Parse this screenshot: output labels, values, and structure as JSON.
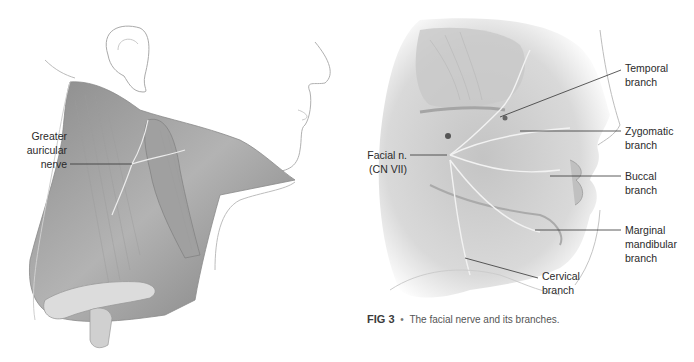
{
  "figure_left": {
    "subject": "neck-lateral-view",
    "labels": {
      "greater_auricular": [
        "Greater",
        "auricular",
        "nerve"
      ]
    }
  },
  "figure_right": {
    "subject": "face-lateral-view-facial-nerve",
    "labels": {
      "temporal": [
        "Temporal",
        "branch"
      ],
      "zygomatic": [
        "Zygomatic",
        "branch"
      ],
      "facial_nerve": [
        "Facial n.",
        "(CN VII)"
      ],
      "buccal": [
        "Buccal",
        "branch"
      ],
      "marginal_mandibular": [
        "Marginal",
        "mandibular",
        "branch"
      ],
      "cervical": [
        "Cervical",
        "branch"
      ]
    }
  },
  "caption": {
    "figure_number": "FIG 3",
    "bullet": "•",
    "text": "The facial nerve and its branches."
  },
  "colors": {
    "label_text": "#2a2a2a",
    "leader_line": "#333333",
    "illustration_shade": "#9a9a9a",
    "outline": "#b5b5b5"
  }
}
